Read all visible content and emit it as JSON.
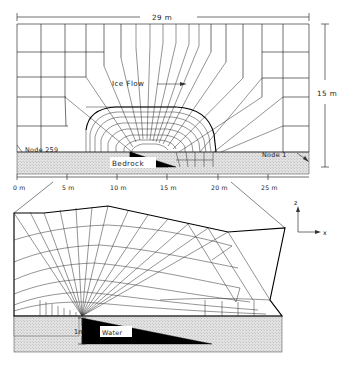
{
  "figure": {
    "type": "finite-element-mesh-diagram",
    "panels": [
      "overview",
      "detail"
    ]
  },
  "overview": {
    "dim_width_label": "29 m",
    "dim_height_label": "15 m",
    "flow_label": "Ice Flow",
    "bedrock_label": "Bedrock",
    "node_left_label": "Node 259",
    "node_right_label": "Node 1",
    "axis_ticks": [
      "0 m",
      "5 m",
      "10 m",
      "15 m",
      "20 m",
      "25 m"
    ],
    "axis_tick_values": [
      0,
      5,
      10,
      15,
      20,
      25
    ],
    "domain_width_m": 29,
    "domain_height_m": 15
  },
  "detail": {
    "water_label": "Water",
    "cavity_height_label": "1m",
    "axis_z_label": "z",
    "axis_x_label": "x"
  },
  "colors": {
    "line": "#111111",
    "bedrock_fill": "#d9d9d9",
    "water_fill": "#000000",
    "background": "#ffffff"
  }
}
